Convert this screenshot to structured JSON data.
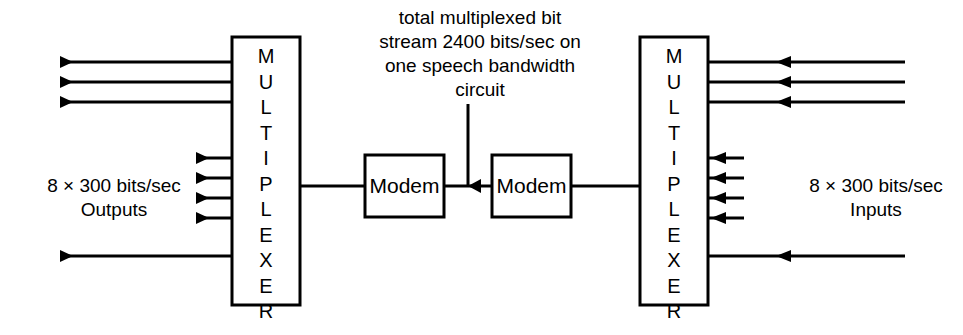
{
  "diagram": {
    "caption": {
      "lines": [
        "total multiplexed bit",
        "stream 2400 bits/sec on",
        "one speech bandwidth",
        "circuit"
      ]
    },
    "blocks": {
      "mux_left": {
        "label": "MULTIPLEXER",
        "label_stacked": "M\nU\nL\nT\nI\nP\nL\nE\nX\nE\nR"
      },
      "mux_right": {
        "label": "MULTIPLEXER",
        "label_stacked": "M\nU\nL\nT\nI\nP\nL\nE\nX\nE\nR"
      },
      "modem_left": {
        "label": "Modem"
      },
      "modem_right": {
        "label": "Modem"
      }
    },
    "side_labels": {
      "left": {
        "line1": "8 × 300 bits/sec",
        "line2": "Outputs"
      },
      "right": {
        "line1": "8 × 300 bits/sec",
        "line2": "Inputs"
      }
    },
    "channels": {
      "left_top_count": 3,
      "left_middle_count": 4,
      "left_bottom_count": 1,
      "right_top_count": 3,
      "right_middle_count": 4,
      "right_bottom_count": 1,
      "total_per_side": 8
    },
    "colors": {
      "stroke": "#000000",
      "background": "#ffffff",
      "text": "#000000"
    },
    "trunk": {
      "rate": "2400 bits/sec",
      "description": "one speech bandwidth circuit"
    },
    "tributary": {
      "rate": "300 bits/sec",
      "count": "8"
    }
  }
}
